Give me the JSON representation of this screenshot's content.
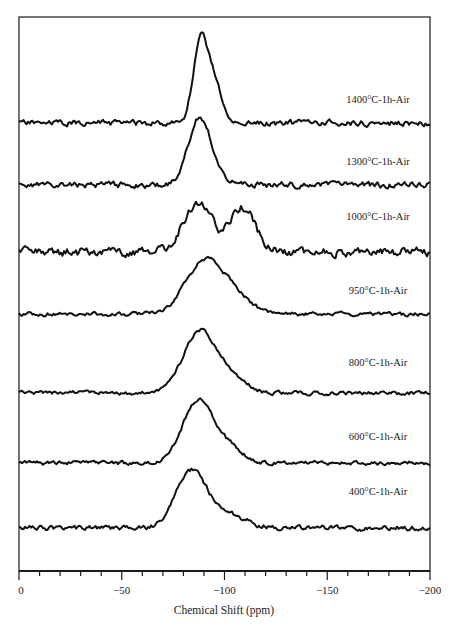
{
  "chart_data": {
    "type": "line",
    "title": "",
    "xlabel": "Chemical Shift (ppm)",
    "ylabel": "",
    "xlim": [
      0,
      -200
    ],
    "x_ticks_major": [
      0,
      -50,
      -100,
      -150,
      -200
    ],
    "x_tick_labels": [
      "0",
      "−50",
      "−100",
      "−150",
      "−200"
    ],
    "x_minor_tick_step": 10,
    "grid": false,
    "legend": "inline labels at right of each stacked trace",
    "stacked": true,
    "series": [
      {
        "name": "1400°C-1h-Air",
        "offset_px": 123,
        "label_y": 103,
        "peaks": [
          {
            "ppm": -88,
            "height": 70,
            "width": 3.5
          },
          {
            "ppm": -93,
            "height": 30,
            "width": 4
          },
          {
            "ppm": -96,
            "height": 18,
            "width": 3
          }
        ],
        "noise": 3,
        "seed": 11
      },
      {
        "name": "1300°C-1h-Air",
        "offset_px": 185,
        "label_y": 165,
        "peaks": [
          {
            "ppm": -87,
            "height": 60,
            "width": 5
          },
          {
            "ppm": -94,
            "height": 18,
            "width": 5
          }
        ],
        "noise": 3,
        "seed": 23
      },
      {
        "name": "1000°C-1h-Air",
        "offset_px": 252,
        "label_y": 220,
        "peaks": [
          {
            "ppm": -87,
            "height": 50,
            "width": 7
          },
          {
            "ppm": -109,
            "height": 44,
            "width": 6
          }
        ],
        "noise": 4.5,
        "seed": 37
      },
      {
        "name": "950°C-1h-Air",
        "offset_px": 314,
        "label_y": 294,
        "peaks": [
          {
            "ppm": -90,
            "height": 52,
            "width": 9
          },
          {
            "ppm": -105,
            "height": 16,
            "width": 8
          }
        ],
        "noise": 2,
        "seed": 41
      },
      {
        "name": "800°C-1h-Air",
        "offset_px": 393,
        "label_y": 366,
        "peaks": [
          {
            "ppm": -88,
            "height": 62,
            "width": 8
          },
          {
            "ppm": -104,
            "height": 14,
            "width": 7
          }
        ],
        "noise": 2,
        "seed": 53
      },
      {
        "name": "600°C-1h-Air",
        "offset_px": 463,
        "label_y": 440,
        "peaks": [
          {
            "ppm": -87,
            "height": 62,
            "width": 7.5
          },
          {
            "ppm": -102,
            "height": 14,
            "width": 7
          }
        ],
        "noise": 2,
        "seed": 67
      },
      {
        "name": "400°C-1h-Air",
        "offset_px": 528,
        "label_y": 495,
        "peaks": [
          {
            "ppm": -84,
            "height": 58,
            "width": 7.5
          },
          {
            "ppm": -103,
            "height": 12,
            "width": 8
          }
        ],
        "noise": 2.5,
        "seed": 79
      }
    ]
  }
}
